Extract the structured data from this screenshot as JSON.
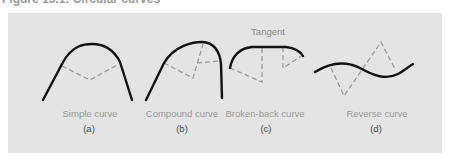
{
  "figure": {
    "caption": "Figure 13.1: Circular curves",
    "panels": [
      {
        "id": "a",
        "name": "Simple curve",
        "sublabel": "(a)"
      },
      {
        "id": "b",
        "name": "Compound curve",
        "sublabel": "(b)"
      },
      {
        "id": "c",
        "name": "Broken-back curve",
        "sublabel": "(c)",
        "annotation": "Tangent"
      },
      {
        "id": "d",
        "name": "Reverse curve",
        "sublabel": "(d)"
      }
    ],
    "colors": {
      "panel_background": "#e4e4e4",
      "curve": "#111111",
      "construction_lines": "#9c9c9c",
      "label_text": "#9a9a9a"
    }
  }
}
